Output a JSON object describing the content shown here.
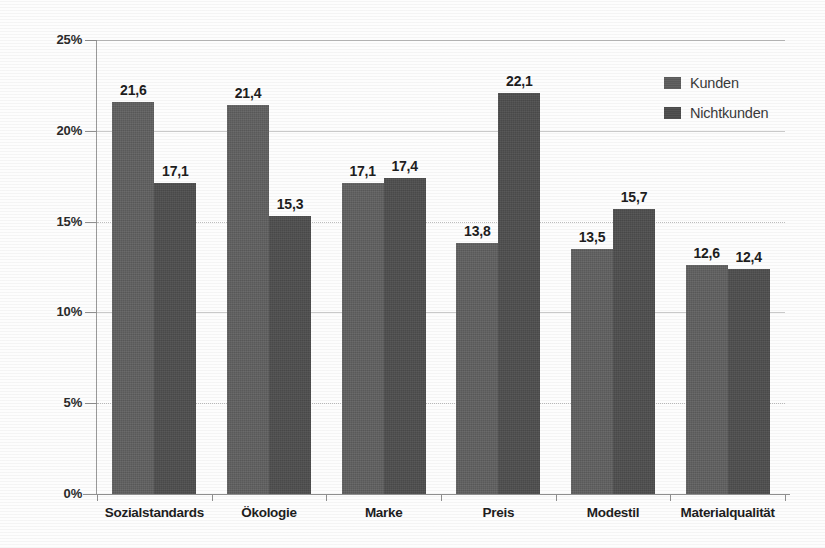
{
  "chart_data": {
    "type": "bar",
    "title": "",
    "subtitle": "",
    "xlabel": "",
    "ylabel": "",
    "ylim": [
      0,
      25
    ],
    "ytick_values": [
      0,
      5,
      10,
      15,
      20,
      25
    ],
    "ytick_labels": [
      "0%",
      "5%",
      "10%",
      "15%",
      "20%",
      "25%"
    ],
    "grid": true,
    "grid_axis": "y",
    "legend_position": "top-right",
    "value_label_format": "comma-decimal",
    "categories": [
      "Sozialstandards",
      "Ökologie",
      "Marke",
      "Preis",
      "Modestil",
      "Materialqualität"
    ],
    "series": [
      {
        "name": "Kunden",
        "color": "#5a5a5a",
        "values": [
          21.6,
          21.4,
          17.1,
          13.8,
          13.5,
          12.6
        ],
        "labels": [
          "21,6",
          "21,4",
          "17,1",
          "13,8",
          "13,5",
          "12,6"
        ]
      },
      {
        "name": "Nichtkunden",
        "color": "#4a4a4a",
        "values": [
          17.1,
          15.3,
          17.4,
          22.1,
          15.7,
          12.4
        ],
        "labels": [
          "17,1",
          "15,3",
          "17,4",
          "22,1",
          "15,7",
          "12,4"
        ]
      }
    ]
  },
  "legend": {
    "items": [
      {
        "label": "Kunden"
      },
      {
        "label": "Nichtkunden"
      }
    ]
  }
}
